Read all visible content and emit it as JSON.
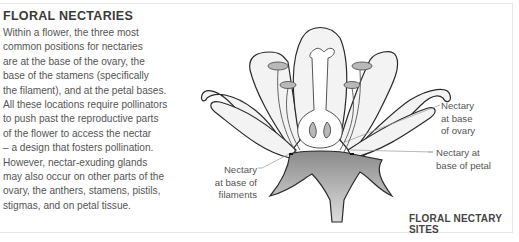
{
  "panel": {
    "title": "FLORAL NECTARIES",
    "body_lines": [
      "Within a flower, the three most",
      "common positions for nectaries",
      "are at the base of the ovary, the",
      "base of the stamens (specifically",
      "the filament), and at the petal bases.",
      "All these locations require pollinators",
      "to push past the reproductive parts",
      "of the flower to access the nectar",
      "– a design that fosters pollination.",
      "However, nectar-exuding glands",
      "may also occur on other parts of the",
      "ovary, the anthers, stamens, pistils,",
      "stigmas, and on petal tissue."
    ]
  },
  "diagram": {
    "caption": "FLORAL NECTARY SITES",
    "labels": {
      "filaments": [
        "Nectary",
        "at base of",
        "filaments"
      ],
      "ovary": [
        "Nectary",
        "at base",
        "of ovary"
      ],
      "petal": [
        "Nectary at",
        "base of petal"
      ]
    },
    "colors": {
      "outline": "#2a2a2a",
      "petal_fill": "#f2f2f2",
      "stamen_fill": "#b8b8b8",
      "receptacle_dark": "#8a8a8a",
      "receptacle_light": "#d6d6d6",
      "leader_line": "#999999"
    }
  }
}
